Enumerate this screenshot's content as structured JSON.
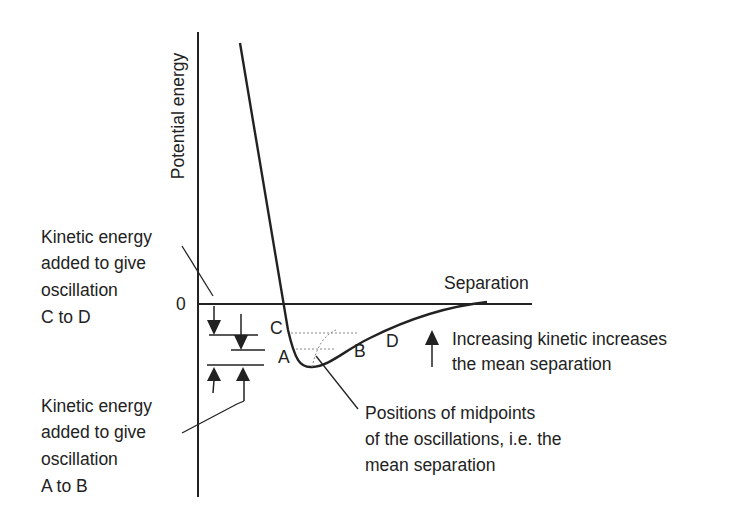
{
  "axes": {
    "y_label": "Potential energy",
    "x_label": "Separation",
    "zero_label": "0"
  },
  "points": {
    "A": "A",
    "B": "B",
    "C": "C",
    "D": "D"
  },
  "annotations": {
    "ke_cd": [
      "Kinetic energy",
      "added to give",
      "oscillation",
      "C to D"
    ],
    "ke_ab": [
      "Kinetic energy",
      "added to give",
      "oscillation",
      "A to B"
    ],
    "increasing": [
      "Increasing kinetic increases",
      "the mean separation"
    ],
    "midpoints": [
      "Positions of midpoints",
      "of the oscillations, i.e. the",
      "mean separation"
    ]
  },
  "colors": {
    "ink": "#222222",
    "dotted": "#888888"
  }
}
